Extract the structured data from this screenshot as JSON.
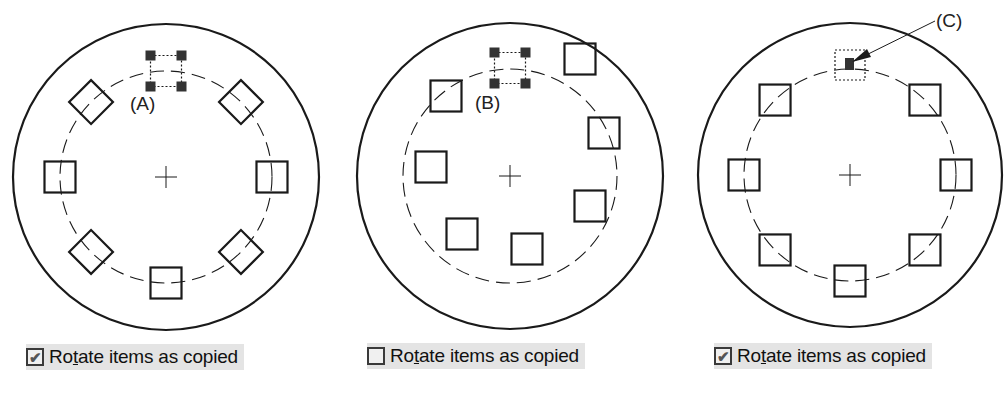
{
  "panels": [
    {
      "id": "A",
      "callout": "(A)",
      "center": [
        166,
        177
      ],
      "outer_radius": 153,
      "dashed_radius": 106,
      "instances": 8,
      "rotated": true,
      "option": {
        "label_pre": "Ro",
        "label_mnemonic": "t",
        "label_post": "ate items as copied",
        "checked": true
      }
    },
    {
      "id": "B",
      "callout": "(B)",
      "center": [
        510,
        176
      ],
      "outer_radius": 153,
      "dashed_radius": 107,
      "instances": 8,
      "rotated": false,
      "option": {
        "label_pre": "Ro",
        "label_mnemonic": "t",
        "label_post": "ate items as copied",
        "checked": false
      }
    },
    {
      "id": "C",
      "callout": "(C)",
      "center": [
        850,
        175
      ],
      "outer_radius": 152,
      "dashed_radius": 106,
      "instances": 8,
      "rotated": false,
      "option": {
        "label_pre": "Ro",
        "label_mnemonic": "t",
        "label_post": "ate items as copied",
        "checked": true
      }
    }
  ],
  "checkbox_glyph": "✔",
  "colors": {
    "line": "#1a1a1a",
    "grip": "#333333",
    "option_bg": "#e4e4e4"
  }
}
